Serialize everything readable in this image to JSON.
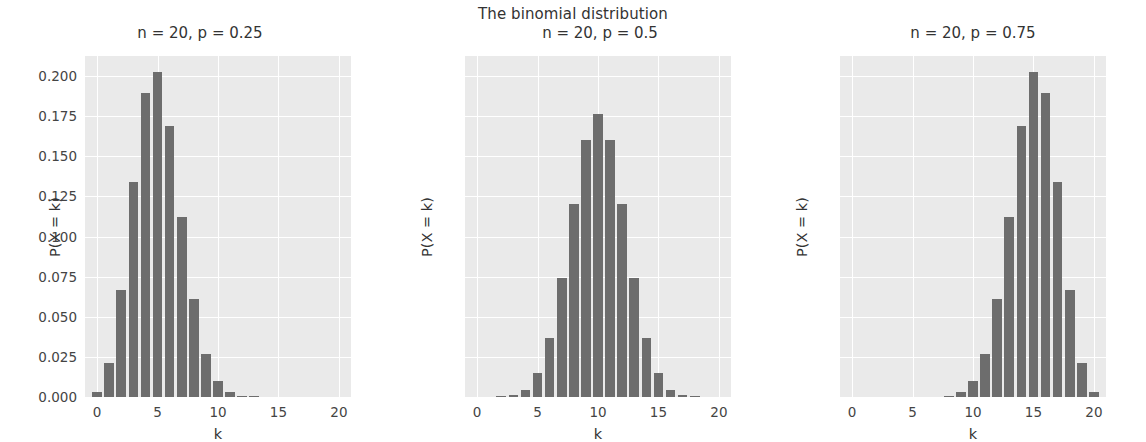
{
  "figure": {
    "suptitle": "The binomial distribution",
    "width": 1146,
    "height": 442,
    "background": "#ffffff",
    "plot_background": "#eaeaea",
    "grid_color": "#ffffff",
    "bar_color": "#6d6d6d",
    "text_color": "#333333"
  },
  "chart_data": [
    {
      "type": "bar",
      "title": "n = 20, p = 0.25",
      "xlabel": "k",
      "ylabel": "P(X = k)",
      "xlim": [
        -1,
        21
      ],
      "ylim": [
        0,
        0.2125
      ],
      "grid": true,
      "xticks": [
        0,
        5,
        10,
        15,
        20
      ],
      "xticklabels": [
        "0",
        "5",
        "10",
        "15",
        "20"
      ],
      "yticks": [
        0.0,
        0.025,
        0.05,
        0.075,
        0.1,
        0.125,
        0.15,
        0.175,
        0.2
      ],
      "yticklabels": [
        "0.000",
        "0.025",
        "0.050",
        "0.075",
        "0.100",
        "0.125",
        "0.150",
        "0.175",
        "0.200"
      ],
      "categories": [
        0,
        1,
        2,
        3,
        4,
        5,
        6,
        7,
        8,
        9,
        10,
        11,
        12,
        13,
        14,
        15,
        16,
        17,
        18,
        19,
        20
      ],
      "values": [
        0.0032,
        0.0211,
        0.0669,
        0.1339,
        0.1897,
        0.2023,
        0.1686,
        0.1124,
        0.0609,
        0.0271,
        0.0099,
        0.003,
        0.0008,
        0.0002,
        0.0,
        0.0,
        0.0,
        0.0,
        0.0,
        0.0,
        0.0
      ]
    },
    {
      "type": "bar",
      "title": "n = 20, p = 0.5",
      "xlabel": "k",
      "ylabel": "P(X = k)",
      "xlim": [
        -1,
        21
      ],
      "ylim": [
        0,
        0.2125
      ],
      "grid": true,
      "xticks": [
        0,
        5,
        10,
        15,
        20
      ],
      "xticklabels": [
        "0",
        "5",
        "10",
        "15",
        "20"
      ],
      "yticks": [
        0.0,
        0.025,
        0.05,
        0.075,
        0.1,
        0.125,
        0.15,
        0.175,
        0.2
      ],
      "yticklabels": [],
      "categories": [
        0,
        1,
        2,
        3,
        4,
        5,
        6,
        7,
        8,
        9,
        10,
        11,
        12,
        13,
        14,
        15,
        16,
        17,
        18,
        19,
        20
      ],
      "values": [
        0.0,
        0.0,
        0.0002,
        0.0011,
        0.0046,
        0.0148,
        0.037,
        0.0739,
        0.1201,
        0.1602,
        0.1762,
        0.1602,
        0.1201,
        0.0739,
        0.037,
        0.0148,
        0.0046,
        0.0011,
        0.0002,
        0.0,
        0.0
      ]
    },
    {
      "type": "bar",
      "title": "n = 20, p = 0.75",
      "xlabel": "k",
      "ylabel": "P(X = k)",
      "xlim": [
        -1,
        21
      ],
      "ylim": [
        0,
        0.2125
      ],
      "grid": true,
      "xticks": [
        0,
        5,
        10,
        15,
        20
      ],
      "xticklabels": [
        "0",
        "5",
        "10",
        "15",
        "20"
      ],
      "yticks": [
        0.0,
        0.025,
        0.05,
        0.075,
        0.1,
        0.125,
        0.15,
        0.175,
        0.2
      ],
      "yticklabels": [],
      "categories": [
        0,
        1,
        2,
        3,
        4,
        5,
        6,
        7,
        8,
        9,
        10,
        11,
        12,
        13,
        14,
        15,
        16,
        17,
        18,
        19,
        20
      ],
      "values": [
        0.0,
        0.0,
        0.0,
        0.0,
        0.0,
        0.0,
        0.0,
        0.0,
        0.0002,
        0.003,
        0.0099,
        0.0271,
        0.0609,
        0.1124,
        0.1686,
        0.2023,
        0.1897,
        0.1339,
        0.0669,
        0.0211,
        0.0032
      ]
    }
  ]
}
